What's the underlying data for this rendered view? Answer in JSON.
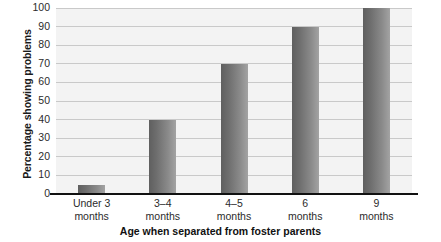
{
  "chart_data": {
    "type": "bar",
    "title": "",
    "xlabel": "Age when separated from foster parents",
    "ylabel": "Percentage showing problems",
    "categories": [
      "Under 3 months",
      "3–4 months",
      "4–5 months",
      "6 months",
      "9 months"
    ],
    "category_lines": [
      [
        "Under 3",
        "months"
      ],
      [
        "3–4",
        "months"
      ],
      [
        "4–5",
        "months"
      ],
      [
        "6",
        "months"
      ],
      [
        "9",
        "months"
      ]
    ],
    "values": [
      5,
      40,
      70,
      90,
      100
    ],
    "ylim": [
      0,
      100
    ],
    "yticks": [
      0,
      10,
      20,
      30,
      40,
      50,
      60,
      70,
      80,
      90,
      100
    ],
    "ytick_labels": [
      "0",
      "10",
      "20",
      "30",
      "40",
      "50",
      "60",
      "70",
      "80",
      "90",
      "100"
    ],
    "grid": true,
    "legend": "none",
    "colors": {
      "bar_dark": "#5f5f5f",
      "bar_light": "#a3a3a3",
      "panel_background": "#f3f3f3",
      "gridline": "#c9c9c9",
      "axis": "#111111",
      "text": "#2b2b2b"
    }
  }
}
